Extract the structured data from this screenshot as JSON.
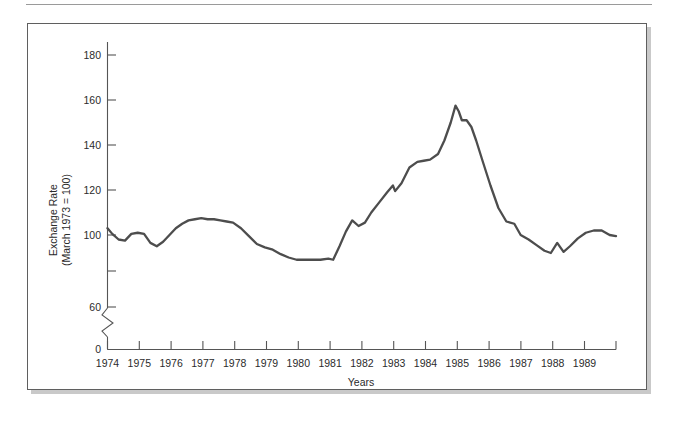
{
  "figure": {
    "frame_border_color": "#5f5f5f",
    "shadow_color": "#c9c9c9",
    "background": "#ffffff"
  },
  "chart_data": {
    "type": "line",
    "title": "",
    "subtitle": "",
    "xlabel": "Years",
    "ylabel": "Exchange Rate\n(March 1973 = 100)",
    "ylabel_line1": "Exchange Rate",
    "ylabel_line2": "(March 1973 = 100)",
    "grid": false,
    "legend": "none",
    "axis_break": {
      "present": true,
      "between": [
        0,
        60
      ],
      "style": "zigzag"
    },
    "xlim": [
      1974.0,
      1990.0
    ],
    "ylim": [
      0,
      190
    ],
    "y_visual_range": [
      55,
      190
    ],
    "ytick_values": [
      0,
      60,
      80,
      100,
      120,
      140,
      160,
      180
    ],
    "ytick_labels": [
      "0",
      "60",
      "",
      "100",
      "120",
      "140",
      "160",
      "180"
    ],
    "ytick_labels_shown": [
      "0",
      "60",
      "100",
      "120",
      "140",
      "160",
      "180"
    ],
    "xtick_values": [
      1974,
      1975,
      1976,
      1977,
      1978,
      1979,
      1980,
      1981,
      1982,
      1983,
      1984,
      1985,
      1986,
      1987,
      1988,
      1989,
      1990
    ],
    "xtick_labels": [
      "1974",
      "1975",
      "1976",
      "1977",
      "1978",
      "1979",
      "1980",
      "1981",
      "1982",
      "1983",
      "1984",
      "1985",
      "1986",
      "1987",
      "1988",
      "1989",
      ""
    ],
    "series": [
      {
        "name": "Trade-weighted exchange rate index",
        "color": "#4d4d4d",
        "line_width": 2.3,
        "x": [
          1974.0,
          1974.15,
          1974.35,
          1974.55,
          1974.75,
          1974.95,
          1975.15,
          1975.35,
          1975.55,
          1975.75,
          1975.95,
          1976.15,
          1976.35,
          1976.55,
          1976.75,
          1976.95,
          1977.15,
          1977.35,
          1977.55,
          1977.75,
          1977.95,
          1978.2,
          1978.45,
          1978.7,
          1978.95,
          1979.2,
          1979.45,
          1979.7,
          1979.95,
          1980.2,
          1980.45,
          1980.7,
          1980.95,
          1981.1,
          1981.3,
          1981.5,
          1981.7,
          1981.9,
          1982.1,
          1982.3,
          1982.55,
          1982.8,
          1982.98,
          1983.05,
          1983.25,
          1983.5,
          1983.75,
          1983.95,
          1984.15,
          1984.4,
          1984.6,
          1984.8,
          1984.95,
          1985.05,
          1985.15,
          1985.3,
          1985.45,
          1985.6,
          1985.8,
          1986.05,
          1986.3,
          1986.55,
          1986.8,
          1987.0,
          1987.25,
          1987.5,
          1987.75,
          1987.95,
          1988.15,
          1988.35,
          1988.55,
          1988.8,
          1989.05,
          1989.3,
          1989.55,
          1989.8,
          1990.0
        ],
        "y": [
          103.0,
          100.5,
          98.0,
          97.5,
          100.5,
          101.0,
          100.5,
          96.5,
          95.0,
          97.0,
          100.0,
          103.0,
          105.0,
          106.5,
          107.0,
          107.5,
          107.0,
          107.0,
          106.5,
          106.0,
          105.5,
          103.0,
          99.5,
          96.0,
          94.5,
          93.5,
          91.5,
          90.0,
          89.0,
          89.0,
          89.0,
          89.0,
          89.5,
          89.0,
          95.0,
          101.5,
          106.5,
          104.0,
          105.5,
          110.0,
          114.5,
          119.0,
          122.0,
          119.5,
          123.0,
          130.0,
          132.5,
          133.0,
          133.5,
          136.0,
          142.0,
          150.0,
          157.5,
          155.0,
          151.0,
          151.0,
          148.0,
          142.0,
          133.0,
          122.0,
          112.0,
          106.0,
          105.0,
          100.0,
          98.0,
          95.5,
          93.0,
          92.0,
          96.5,
          92.5,
          95.0,
          98.5,
          101.0,
          102.0,
          102.0,
          100.0,
          99.5
        ]
      }
    ],
    "annotations": [],
    "notable_points": {
      "start_1974": 103.0,
      "trough_1975": 95.0,
      "peak_1977": 107.5,
      "plateau_1979_1980": 89.0,
      "peak_1985": 157.5,
      "end_1990": 99.5
    }
  }
}
